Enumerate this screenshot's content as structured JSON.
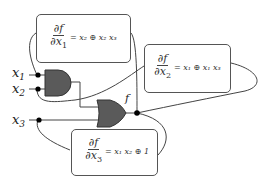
{
  "diagram": {
    "type": "logic-circuit-with-partial-derivative-annotations",
    "inputs": [
      {
        "name": "x",
        "sub": "1"
      },
      {
        "name": "x",
        "sub": "2"
      },
      {
        "name": "x",
        "sub": "3"
      }
    ],
    "output": {
      "label": "f"
    },
    "gates": [
      {
        "id": "and",
        "type": "AND",
        "inputs": [
          "x1",
          "x2"
        ]
      },
      {
        "id": "or",
        "type": "OR",
        "inputs": [
          "and",
          "x3"
        ],
        "output": "f"
      }
    ],
    "annotations": [
      {
        "id": "d1",
        "numerator": "∂f",
        "denominator": "∂x",
        "denominator_sub": "1",
        "equals": "=",
        "rhs": "x₂ ⊕ x₂ x₃"
      },
      {
        "id": "d2",
        "numerator": "∂f",
        "denominator": "∂x",
        "denominator_sub": "2",
        "equals": "=",
        "rhs": "x₁ ⊕ x₁ x₃"
      },
      {
        "id": "d3",
        "numerator": "∂f",
        "denominator": "∂x",
        "denominator_sub": "3",
        "equals": "=",
        "rhs": "x₁ x₂ ⊕ 1"
      }
    ],
    "colors": {
      "gate_fill": "#5a5a5a",
      "wire": "#444444",
      "node": "#000000",
      "box_border": "#555555"
    }
  }
}
